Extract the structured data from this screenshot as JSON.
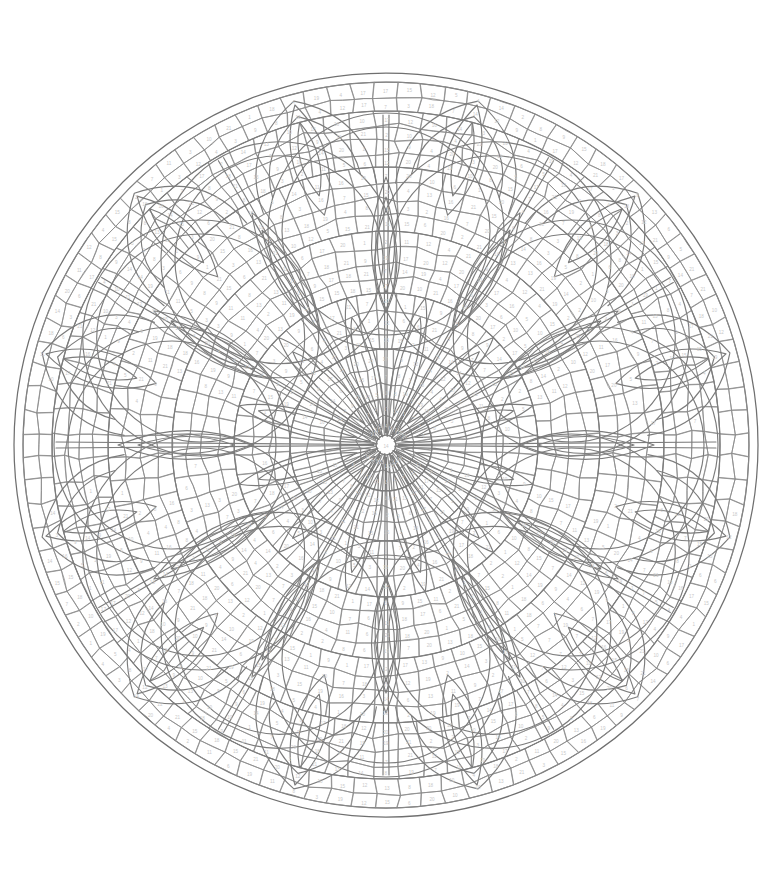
{
  "page": {
    "background_color": "#ffffff",
    "width": 781,
    "height": 871
  },
  "artwork": {
    "name": "geometric-rosette-mandala",
    "type": "color-by-number coloring page",
    "description": "Circular rosette mandala filled with small mosaic cells, each labelled with a tiny palette number",
    "symmetry_order": 12,
    "mirror_symmetry": true,
    "center": {
      "x": 386,
      "y": 445
    },
    "outer_radius": 372,
    "inner_radius": 363,
    "colors": {
      "cell_stroke": "#8d8d8d",
      "band_stroke": "#7c7c7c",
      "rim_stroke": "#6f6f6f",
      "number_fill": "#c9c9c9",
      "fill": "#ffffff"
    },
    "stroke_widths": {
      "cell": 0.85,
      "band": 1.15,
      "rim": 1.25
    },
    "number_font_size": 4.6,
    "palette_numbers": [
      1,
      2,
      3,
      4,
      5,
      6,
      7,
      8,
      9,
      10,
      11,
      12,
      13,
      14,
      15,
      16,
      17,
      18,
      19,
      20,
      21
    ],
    "ring_layout": [
      {
        "name": "center-hub",
        "r_inner": 0,
        "r_outer": 10,
        "cells": 1,
        "subdivisions": 1
      },
      {
        "name": "core-star-ring",
        "r_inner": 10,
        "r_outer": 46,
        "cells": 24,
        "subdivisions": 2
      },
      {
        "name": "petal-ring-1",
        "r_inner": 46,
        "r_outer": 96,
        "cells": 36,
        "subdivisions": 3
      },
      {
        "name": "lens-ring",
        "r_inner": 96,
        "r_outer": 152,
        "cells": 48,
        "subdivisions": 3
      },
      {
        "name": "mid-mosaic-ring",
        "r_inner": 152,
        "r_outer": 214,
        "cells": 60,
        "subdivisions": 4
      },
      {
        "name": "eye-ring",
        "r_inner": 214,
        "r_outer": 278,
        "cells": 72,
        "subdivisions": 4
      },
      {
        "name": "arch-ring",
        "r_inner": 278,
        "r_outer": 334,
        "cells": 84,
        "subdivisions": 4
      },
      {
        "name": "outer-rim-ring",
        "r_inner": 334,
        "r_outer": 363,
        "cells": 96,
        "subdivisions": 2
      }
    ],
    "motifs": [
      {
        "name": "center-rosette",
        "count": 1,
        "shape": "12-point star"
      },
      {
        "name": "inner-petal",
        "count": 12,
        "shape": "pointed lancet petal"
      },
      {
        "name": "lens-eye",
        "count": 12,
        "shape": "pointed oval / vesica"
      },
      {
        "name": "outer-arch",
        "count": 12,
        "shape": "gothic arch"
      },
      {
        "name": "interlace-circle",
        "count": 12,
        "shape": "overlapping circle arc"
      },
      {
        "name": "radial-spoke",
        "count": 12,
        "shape": "tapered wedge"
      }
    ]
  }
}
